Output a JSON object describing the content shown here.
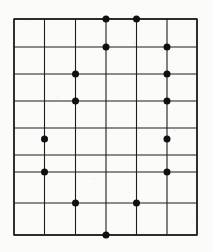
{
  "figure": {
    "background_color": "#fbfbfa",
    "line_color": "#1d1d1d",
    "dot_color": "#101010",
    "border_color": "#1d1d1d",
    "line_width": 1.1,
    "border_width": 1.4,
    "dot_radius": 3.5,
    "width": 213,
    "height": 252
  },
  "chart_data": {
    "type": "scatter",
    "subtitle": "",
    "xlabel": "",
    "ylabel": "",
    "grid": true,
    "legend": null,
    "xlim": [
      14,
      197
    ],
    "ylim": [
      19,
      235
    ],
    "grid_vertical_x": [
      14,
      44.5,
      75.5,
      106,
      136.5,
      167,
      197
    ],
    "grid_horizontal_y": [
      19,
      47,
      74,
      101,
      128,
      155,
      172,
      203,
      235
    ],
    "columns": 6,
    "rows": 8,
    "points": [
      {
        "x": 106,
        "y": 19
      },
      {
        "x": 136.5,
        "y": 19
      },
      {
        "x": 106,
        "y": 47
      },
      {
        "x": 167,
        "y": 47
      },
      {
        "x": 75.5,
        "y": 74
      },
      {
        "x": 167,
        "y": 74
      },
      {
        "x": 75.5,
        "y": 101
      },
      {
        "x": 167,
        "y": 101
      },
      {
        "x": 44.5,
        "y": 139
      },
      {
        "x": 167,
        "y": 139
      },
      {
        "x": 44.5,
        "y": 172
      },
      {
        "x": 167,
        "y": 172
      },
      {
        "x": 75.5,
        "y": 203
      },
      {
        "x": 136.5,
        "y": 203
      },
      {
        "x": 106,
        "y": 235
      }
    ],
    "point_count": 15
  }
}
